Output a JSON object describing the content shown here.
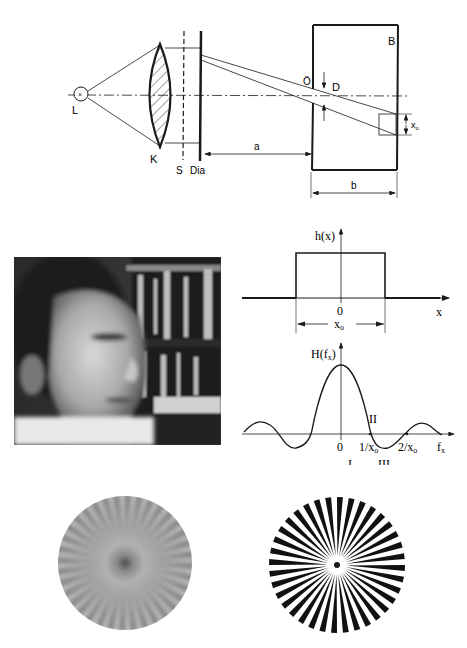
{
  "optical_diagram": {
    "labels": {
      "lamp": "L",
      "condenser": "K",
      "stop": "S",
      "slide": "Dia",
      "aperture_opening": "Ö",
      "aperture_diameter": "D",
      "box": "B",
      "distance_a": "a",
      "distance_b": "b",
      "image_size": "x",
      "image_size_sub": "o"
    }
  },
  "rect_plot": {
    "ylabel": "h(x)",
    "xlabel": "x",
    "origin": "0",
    "width_label": "x",
    "width_label_sub": "o"
  },
  "sinc_plot": {
    "ylabel": "H(f",
    "ylabel_sub": "x",
    "ylabel_close": ")",
    "xlabel": "f",
    "xlabel_sub": "x",
    "origin": "0",
    "tick1": "1/x",
    "tick1_sub": "o",
    "tick2": "2/x",
    "tick2_sub": "o",
    "region_I": "I",
    "region_II": "II",
    "region_III": "III"
  },
  "chart_data": [
    {
      "type": "line",
      "title": "h(x) rectangle function",
      "xlabel": "x",
      "ylabel": "h(x)",
      "x": [
        "-inf",
        "-x0/2",
        "-x0/2",
        "x0/2",
        "x0/2",
        "+inf"
      ],
      "values": [
        0,
        0,
        1,
        1,
        0,
        0
      ],
      "annotations": [
        "0",
        "x_o (width)"
      ]
    },
    {
      "type": "line",
      "title": "H(f_x) sinc transfer function",
      "xlabel": "f_x",
      "ylabel": "H(f_x)",
      "x": [
        "-2/x0",
        "-1/x0",
        "0",
        "1/x0",
        "2/x0"
      ],
      "values": [
        0,
        0,
        1,
        0,
        0
      ],
      "annotations": [
        "I",
        "II",
        "III",
        "0",
        "1/x_o",
        "2/x_o"
      ]
    }
  ],
  "images": {
    "portrait_alt": "Portrait photo of a man in front of a bookshelf",
    "star_blurred_alt": "Blurred Siemens star",
    "star_sharp_alt": "Sharp Siemens star"
  },
  "colors": {
    "ink": "#1a1a1a",
    "paper": "#ffffff",
    "gray_star": "#b0b0b0"
  }
}
